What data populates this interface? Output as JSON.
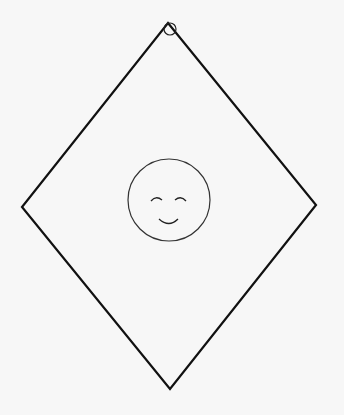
{
  "diagram": {
    "background": "#f7f7f7",
    "stroke_color": "#111111",
    "diamond": {
      "top": [
        168,
        23
      ],
      "right": [
        316,
        205
      ],
      "bottom": [
        170,
        389
      ],
      "left": [
        22,
        207
      ]
    },
    "hole": {
      "cx": 170,
      "cy": 29,
      "r": 6
    },
    "face": {
      "cx": 169,
      "cy": 200,
      "r": 41,
      "expression": "smile"
    }
  }
}
